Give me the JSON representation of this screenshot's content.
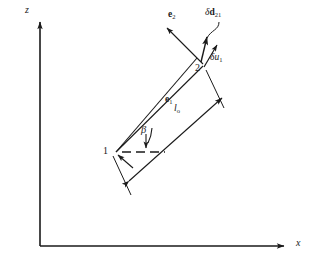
{
  "figure": {
    "type": "vector-mechanics-diagram",
    "background_color": "#ffffff",
    "ink_color": "#1a1a1a",
    "width": 310,
    "height": 263
  },
  "axes": {
    "vertical": {
      "label": "z",
      "label_x": 25,
      "label_y": 11,
      "origin_x": 40,
      "origin_y": 246,
      "tip_x": 40,
      "tip_y": 18
    },
    "horizontal": {
      "label": "x",
      "label_x": 296,
      "label_y": 243,
      "origin_x": 40,
      "origin_y": 246,
      "tip_x": 288,
      "tip_y": 246
    }
  },
  "nodes": [
    {
      "id": "node-1",
      "label": "1",
      "x": 116,
      "y": 152,
      "label_x": 104,
      "label_y": 147
    },
    {
      "id": "node-2",
      "label": "2",
      "x": 201,
      "y": 62,
      "label_x": 196,
      "label_y": 68
    }
  ],
  "vectors": {
    "e1": {
      "name": "e1",
      "label_main": "e",
      "label_sub": "1",
      "label_x": 167,
      "label_y": 99,
      "bold": true
    },
    "e2": {
      "name": "e2",
      "label_main": "e",
      "label_sub": "2",
      "label_x": 170,
      "label_y": 14,
      "bold": true,
      "from_x": 201,
      "from_y": 62,
      "to_x": 166,
      "to_y": 27
    },
    "delta_d21": {
      "name": "delta-d-21",
      "label_greek": "δ",
      "label_main": "d",
      "label_sub": "21",
      "label_x": 209,
      "label_y": 12,
      "bold": true,
      "from_x": 201,
      "from_y": 62,
      "to_x": 207,
      "to_y": 35
    },
    "delta_u1": {
      "name": "delta-u-1",
      "label_greek": "δ",
      "label_main": "u",
      "label_sub": "1",
      "label_x": 211,
      "label_y": 57,
      "bold": false,
      "from_x": 203,
      "from_y": 66,
      "to_x": 216,
      "to_y": 44
    }
  },
  "angle": {
    "name": "beta",
    "label": "β",
    "label_x": 141,
    "label_y": 131,
    "vertex_x": 116,
    "vertex_y": 152
  },
  "length": {
    "name": "l0",
    "label_main": "l",
    "label_sub": "o",
    "label_x": 175,
    "label_y": 108
  },
  "reference_line": {
    "name": "horizontal-dashed-reference",
    "from_x": 122,
    "from_y": 152,
    "to_x": 164,
    "to_y": 152
  }
}
